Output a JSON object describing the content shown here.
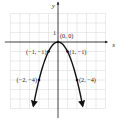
{
  "chart_data": {
    "type": "line",
    "title": "",
    "function": "y = -x^2",
    "xlabel": "x",
    "ylabel": "y",
    "xlim": [
      -5,
      5
    ],
    "ylim": [
      -7,
      4
    ],
    "grid": true,
    "tick_labels": [
      {
        "axis": "y",
        "value": 1,
        "text": "1"
      }
    ],
    "series": [
      {
        "name": "parabola",
        "x": [
          -2.6,
          -2,
          -1.5,
          -1,
          -0.5,
          0,
          0.5,
          1,
          1.5,
          2,
          2.6
        ],
        "y": [
          -6.76,
          -4,
          -2.25,
          -1,
          -0.25,
          0,
          -0.25,
          -1,
          -2.25,
          -4,
          -6.76
        ],
        "arrows_at_ends": true
      }
    ],
    "points": [
      {
        "x": 0,
        "y": 0,
        "label": "(0, 0)"
      },
      {
        "x": -1,
        "y": -1,
        "label": "(−1, −1)"
      },
      {
        "x": 1,
        "y": -1,
        "label": "(1, −1)"
      },
      {
        "x": -2,
        "y": -4,
        "label": "(−2, −4)"
      },
      {
        "x": 2,
        "y": -4,
        "label": "(2, −4)"
      }
    ],
    "colors": {
      "curve": "#111111",
      "grid": "#d6d6d6",
      "axis": "#1a1a1a"
    }
  }
}
